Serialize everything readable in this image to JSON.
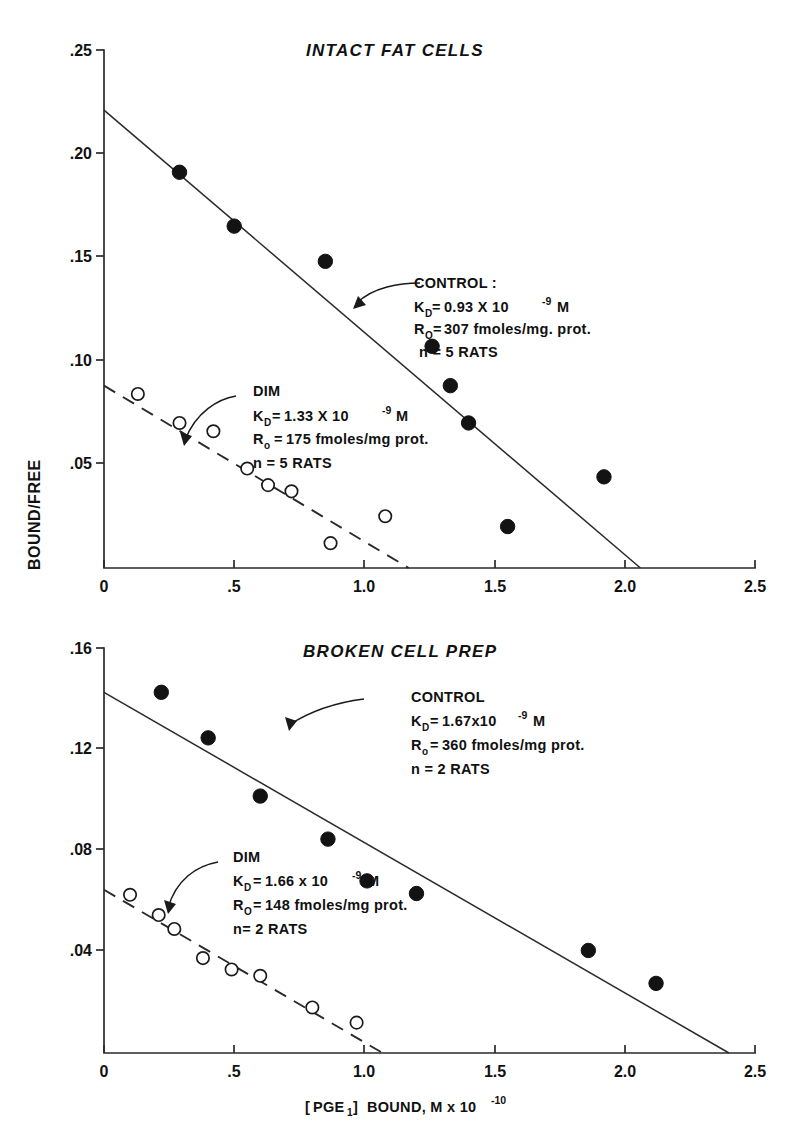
{
  "figure": {
    "background_color": "#ffffff",
    "ink_color": "#131313",
    "xlabel_parts": {
      "bracket_open": "[",
      "species": "PGE",
      "species_sub": "1",
      "bracket_close": "]",
      "rest": "BOUND, M x 10",
      "exponent": "-10"
    },
    "xlabel": "[PGE1] BOUND, M x 10^-10",
    "ylabel": "BOUND/FREE"
  },
  "chart_data": [
    {
      "type": "scatter",
      "title": "INTACT FAT CELLS",
      "xlabel": "[PGE1] BOUND, M x 10^-10",
      "ylabel": "BOUND/FREE",
      "xlim": [
        0,
        2.5
      ],
      "ylim": [
        0,
        0.25
      ],
      "xticks": [
        0,
        0.5,
        1.0,
        1.5,
        2.0,
        2.5
      ],
      "xticklabels": [
        "0",
        ".5",
        "1.0",
        "1.5",
        "2.0",
        "2.5"
      ],
      "yticks": [
        0.05,
        0.1,
        0.15,
        0.2,
        0.25
      ],
      "yticklabels": [
        ".05",
        ".10",
        ".15",
        ".20",
        ".25"
      ],
      "grid": false,
      "legend": "none",
      "series": [
        {
          "name": "CONTROL",
          "marker": "filled-circle",
          "linestyle": "solid",
          "points": [
            {
              "x": 0.29,
              "y": 0.191
            },
            {
              "x": 0.5,
              "y": 0.165
            },
            {
              "x": 0.85,
              "y": 0.148
            },
            {
              "x": 1.26,
              "y": 0.107
            },
            {
              "x": 1.33,
              "y": 0.088
            },
            {
              "x": 1.4,
              "y": 0.07
            },
            {
              "x": 1.92,
              "y": 0.044
            },
            {
              "x": 1.55,
              "y": 0.02
            }
          ],
          "fit_line": {
            "x0": 0.0,
            "y0": 0.221,
            "x1": 2.06,
            "y1": 0.0
          },
          "annotation": {
            "label": "CONTROL :",
            "kd_symbol": "K",
            "kd_sub": "D",
            "kd_value": "0.93 X 10",
            "kd_exp": "-9",
            "kd_unit": "M",
            "ro_symbol": "R",
            "ro_sub": "O",
            "ro_value": "307 fmoles/mg. prot.",
            "n": "n = 5 RATS"
          }
        },
        {
          "name": "DIM",
          "marker": "open-circle",
          "linestyle": "dashed",
          "points": [
            {
              "x": 0.13,
              "y": 0.084
            },
            {
              "x": 0.29,
              "y": 0.07
            },
            {
              "x": 0.42,
              "y": 0.066
            },
            {
              "x": 0.55,
              "y": 0.048
            },
            {
              "x": 0.63,
              "y": 0.04
            },
            {
              "x": 0.72,
              "y": 0.037
            },
            {
              "x": 1.08,
              "y": 0.025
            },
            {
              "x": 0.87,
              "y": 0.012
            }
          ],
          "fit_line": {
            "x0": 0.0,
            "y0": 0.088,
            "x1": 1.17,
            "y1": 0.0
          },
          "annotation": {
            "label": "DIM",
            "kd_symbol": "K",
            "kd_sub": "D",
            "kd_value": "1.33 X 10",
            "kd_exp": "-9",
            "kd_unit": "M",
            "ro_symbol": "R",
            "ro_sub": "o",
            "ro_value": "175 fmoles/mg prot.",
            "n": "n = 5 RATS"
          }
        }
      ]
    },
    {
      "type": "scatter",
      "title": "BROKEN CELL PREP",
      "xlabel": "[PGE1] BOUND, M x 10^-10",
      "ylabel": "BOUND/FREE",
      "xlim": [
        0,
        2.5
      ],
      "ylim": [
        0,
        0.16
      ],
      "xticks": [
        0,
        0.5,
        1.0,
        1.5,
        2.0,
        2.5
      ],
      "xticklabels": [
        "0",
        ".5",
        "1.0",
        "1.5",
        "2.0",
        "2.5"
      ],
      "yticks": [
        0.04,
        0.08,
        0.12,
        0.16
      ],
      "yticklabels": [
        ".04",
        ".08",
        ".12",
        ".16"
      ],
      "grid": false,
      "legend": "none",
      "series": [
        {
          "name": "CONTROL",
          "marker": "filled-circle",
          "linestyle": "solid",
          "points": [
            {
              "x": 0.22,
              "y": 0.1425
            },
            {
              "x": 0.4,
              "y": 0.1245
            },
            {
              "x": 0.6,
              "y": 0.1015
            },
            {
              "x": 0.86,
              "y": 0.0845
            },
            {
              "x": 1.01,
              "y": 0.068
            },
            {
              "x": 1.2,
              "y": 0.063
            },
            {
              "x": 1.86,
              "y": 0.0405
            },
            {
              "x": 2.12,
              "y": 0.0275
            }
          ],
          "fit_line": {
            "x0": 0.0,
            "y0": 0.1425,
            "x1": 2.4,
            "y1": 0.0
          },
          "annotation": {
            "label": "CONTROL",
            "kd_symbol": "K",
            "kd_sub": "D",
            "kd_value": "1.67x10",
            "kd_exp": "-9",
            "kd_unit": "M",
            "ro_symbol": "R",
            "ro_sub": "o",
            "ro_value": "360 fmoles/mg prot.",
            "n": "n = 2 RATS"
          }
        },
        {
          "name": "DIM",
          "marker": "open-circle",
          "linestyle": "dashed",
          "points": [
            {
              "x": 0.1,
              "y": 0.0625
            },
            {
              "x": 0.21,
              "y": 0.0545
            },
            {
              "x": 0.27,
              "y": 0.049
            },
            {
              "x": 0.38,
              "y": 0.0375
            },
            {
              "x": 0.49,
              "y": 0.033
            },
            {
              "x": 0.6,
              "y": 0.0305
            },
            {
              "x": 0.8,
              "y": 0.018
            },
            {
              "x": 0.97,
              "y": 0.012
            }
          ],
          "fit_line": {
            "x0": 0.0,
            "y0": 0.0645,
            "x1": 1.07,
            "y1": 0.0
          },
          "annotation": {
            "label": "DIM",
            "kd_symbol": "K",
            "kd_sub": "D",
            "kd_value": "1.66 x 10",
            "kd_exp": "-9",
            "kd_unit": "M",
            "ro_symbol": "R",
            "ro_sub": "O",
            "ro_value": "148 fmoles/mg prot.",
            "n": "n= 2 RATS"
          }
        }
      ]
    }
  ]
}
